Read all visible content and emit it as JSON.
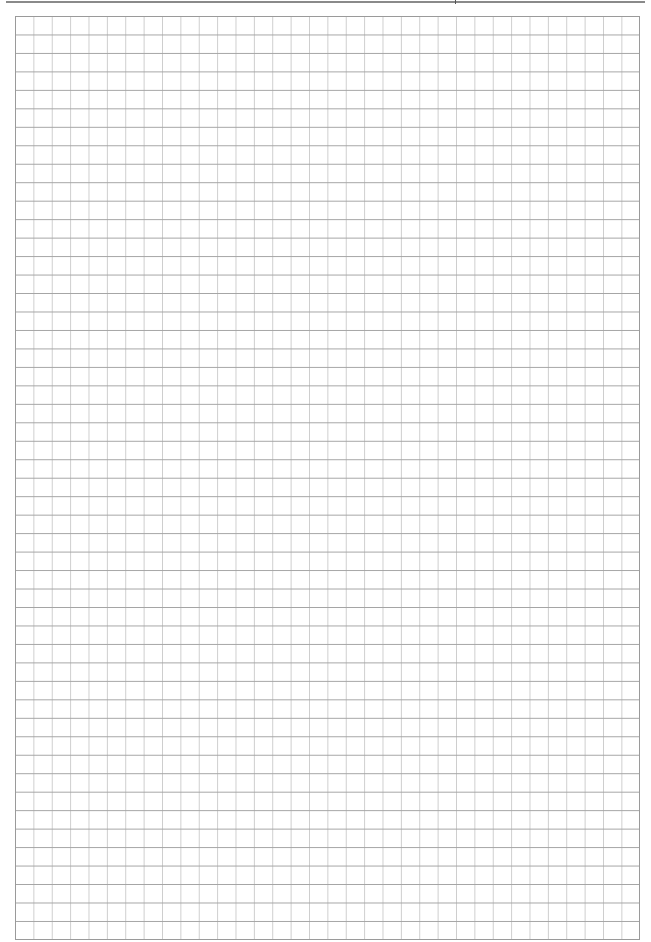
{
  "page": {
    "type": "graph-paper",
    "grid": {
      "columns": 34,
      "rows": 50,
      "cell_size_px": 18.4,
      "horizontal_line_color": "#a4a4a4",
      "vertical_line_color": "#cdcdcd",
      "border_color": "#9a9a9a"
    },
    "header_rule_color": "#8a8a8a",
    "background": "#ffffff"
  }
}
